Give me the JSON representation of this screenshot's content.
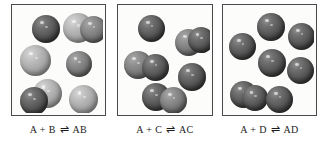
{
  "figure": {
    "kind": "molecular-equilibrium-diagram",
    "background_color": "#ffffff",
    "border_color": "#4a4a4a",
    "sphere_colors": {
      "dark": "#4d4d4d",
      "mid": "#777777",
      "light": "#b0b0b0"
    }
  },
  "panels": [
    {
      "id": "panel-ab",
      "caption": {
        "left": "A + B",
        "arrow": "⇌",
        "right": "AB",
        "full": "A + B ⇌ AB"
      },
      "spheres": [
        {
          "name": "sphere-a-1",
          "shade": "dark",
          "x": 18,
          "y": 8,
          "d": 28
        },
        {
          "name": "sphere-b-1",
          "shade": "light",
          "x": 49,
          "y": 6,
          "d": 30
        },
        {
          "name": "sphere-a-2",
          "shade": "mid",
          "x": 66,
          "y": 9,
          "d": 27
        },
        {
          "name": "sphere-b-2",
          "shade": "light",
          "x": 6,
          "y": 38,
          "d": 31
        },
        {
          "name": "sphere-a-3",
          "shade": "mid",
          "x": 52,
          "y": 44,
          "d": 26
        },
        {
          "name": "sphere-b-3",
          "shade": "light",
          "x": 19,
          "y": 72,
          "d": 29
        },
        {
          "name": "sphere-a-4",
          "shade": "dark",
          "x": 6,
          "y": 80,
          "d": 28
        },
        {
          "name": "sphere-b-4",
          "shade": "light",
          "x": 55,
          "y": 78,
          "d": 29
        }
      ]
    },
    {
      "id": "panel-ac",
      "caption": {
        "left": "A + C",
        "arrow": "⇌",
        "right": "AC",
        "full": "A + C ⇌ AC"
      },
      "spheres": [
        {
          "name": "sphere-a-1",
          "shade": "dark",
          "x": 18,
          "y": 8,
          "d": 27
        },
        {
          "name": "sphere-c-1",
          "shade": "mid",
          "x": 55,
          "y": 22,
          "d": 27
        },
        {
          "name": "sphere-a-2",
          "shade": "dark",
          "x": 68,
          "y": 20,
          "d": 26
        },
        {
          "name": "sphere-c-2",
          "shade": "mid",
          "x": 4,
          "y": 44,
          "d": 28
        },
        {
          "name": "sphere-a-3",
          "shade": "dark",
          "x": 22,
          "y": 47,
          "d": 27
        },
        {
          "name": "sphere-c-3",
          "shade": "dark",
          "x": 58,
          "y": 56,
          "d": 28
        },
        {
          "name": "sphere-a-4",
          "shade": "dark",
          "x": 22,
          "y": 76,
          "d": 28
        },
        {
          "name": "sphere-c-4",
          "shade": "mid",
          "x": 40,
          "y": 80,
          "d": 27
        }
      ]
    },
    {
      "id": "panel-ad",
      "caption": {
        "left": "A + D",
        "arrow": "⇌",
        "right": "AD",
        "full": "A + D ⇌ AD"
      },
      "spheres": [
        {
          "name": "sphere-d-1",
          "shade": "dark",
          "x": 32,
          "y": 6,
          "d": 28
        },
        {
          "name": "sphere-a-1",
          "shade": "dark",
          "x": 63,
          "y": 16,
          "d": 27
        },
        {
          "name": "sphere-d-2",
          "shade": "dark",
          "x": 4,
          "y": 26,
          "d": 27
        },
        {
          "name": "sphere-a-2",
          "shade": "dark",
          "x": 33,
          "y": 42,
          "d": 28
        },
        {
          "name": "sphere-d-3",
          "shade": "dark",
          "x": 62,
          "y": 50,
          "d": 27
        },
        {
          "name": "sphere-a-3",
          "shade": "dark",
          "x": 5,
          "y": 74,
          "d": 27
        },
        {
          "name": "sphere-d-4",
          "shade": "dark",
          "x": 17,
          "y": 78,
          "d": 26
        },
        {
          "name": "sphere-a-4",
          "shade": "dark",
          "x": 41,
          "y": 79,
          "d": 27
        }
      ]
    }
  ]
}
